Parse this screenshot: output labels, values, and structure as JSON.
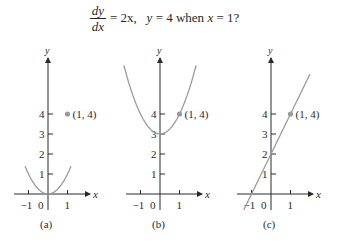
{
  "question": {
    "numerator": "dy",
    "denominator": "dx",
    "rhs": "= 2x,",
    "condition_y": "y",
    "condition_eq": "= 4 when",
    "condition_x": "x",
    "condition_val": "= 1?"
  },
  "style": {
    "axis_color": "#2a2a2a",
    "curve_color": "#9a9a9a",
    "point_color": "#9a9a9a"
  },
  "chart_data": [
    {
      "type": "line",
      "title": "(a)",
      "function": "y = x^2",
      "xlabel": "x",
      "ylabel": "y",
      "x_ticks": [
        -1,
        0,
        1
      ],
      "y_ticks": [
        1,
        2,
        3,
        4
      ],
      "xlim": [
        -1.6,
        1.8
      ],
      "ylim": [
        0,
        7
      ],
      "highlight_point": {
        "x": 1,
        "y": 4,
        "label": "(1, 4)"
      },
      "samples": {
        "x": [
          -1.2,
          -1,
          -0.5,
          0,
          0.5,
          1,
          1.2
        ],
        "y": [
          6.3,
          4,
          1,
          0,
          1,
          4,
          6.3
        ]
      }
    },
    {
      "type": "line",
      "title": "(b)",
      "function": "y = x^2 + 3",
      "xlabel": "x",
      "ylabel": "y",
      "x_ticks": [
        -1,
        0,
        1
      ],
      "y_ticks": [
        1,
        2,
        3,
        4
      ],
      "xlim": [
        -1.6,
        1.8
      ],
      "ylim": [
        0,
        7
      ],
      "highlight_point": {
        "x": 1,
        "y": 4,
        "label": "(1, 4)"
      },
      "samples": {
        "x": [
          -1.8,
          -1,
          0,
          1,
          1.8
        ],
        "y": [
          6.2,
          4,
          3,
          4,
          6.2
        ]
      }
    },
    {
      "type": "line",
      "title": "(c)",
      "function": "y = 2x + 2",
      "xlabel": "x",
      "ylabel": "y",
      "x_ticks": [
        -1,
        0,
        1
      ],
      "y_ticks": [
        1,
        2,
        3,
        4
      ],
      "xlim": [
        -1.6,
        1.8
      ],
      "ylim": [
        0,
        7
      ],
      "highlight_point": {
        "x": 1,
        "y": 4,
        "label": "(1, 4)"
      },
      "samples": {
        "x": [
          -1.4,
          -1,
          0,
          1,
          2
        ],
        "y": [
          -0.8,
          0,
          2,
          4,
          6
        ]
      }
    }
  ],
  "panels": [
    {
      "caption": "(a)",
      "origin_label": "0",
      "neg_label": "−1",
      "pos_label": "1",
      "y_labels": [
        "1",
        "2",
        "3",
        "4"
      ],
      "point_label": "(1, 4)",
      "x_axis_label": "x",
      "y_axis_label": "y"
    },
    {
      "caption": "(b)",
      "origin_label": "0",
      "neg_label": "−1",
      "pos_label": "1",
      "y_labels": [
        "1",
        "2",
        "3",
        "4"
      ],
      "point_label": "(1, 4)",
      "x_axis_label": "x",
      "y_axis_label": "y"
    },
    {
      "caption": "(c)",
      "origin_label": "0",
      "neg_label": "−1",
      "pos_label": "1",
      "y_labels": [
        "1",
        "2",
        "3",
        "4"
      ],
      "point_label": "(1, 4)",
      "x_axis_label": "x",
      "y_axis_label": "y"
    }
  ]
}
